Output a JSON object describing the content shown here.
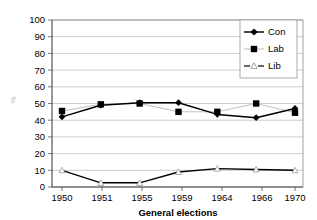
{
  "chart_data": {
    "type": "line",
    "title": "",
    "xlabel": "General elections",
    "ylabel": "%",
    "categories": [
      "1950",
      "1951",
      "1955",
      "1959",
      "1964",
      "1966",
      "1970"
    ],
    "series": [
      {
        "name": "Con",
        "marker": "diamond",
        "line": "solid",
        "color": "#000000",
        "values": [
          42,
          49,
          50.5,
          50.5,
          43.5,
          41.5,
          47
        ]
      },
      {
        "name": "Lab",
        "marker": "square",
        "line": "solid",
        "color": "#000000",
        "values": [
          45.5,
          49.5,
          50,
          45,
          45,
          50,
          44.5
        ]
      },
      {
        "name": "Lib",
        "marker": "triangle-open",
        "line": "dashed",
        "color": "#000000",
        "values": [
          10,
          2.5,
          2.5,
          9,
          11,
          10.5,
          10
        ]
      }
    ],
    "ylim": [
      0,
      100
    ],
    "yticks": [
      "0",
      "10",
      "20",
      "30",
      "40",
      "50",
      "60",
      "70",
      "80",
      "90",
      "100"
    ],
    "grid": true,
    "legend_position": "top-right",
    "legend_entries": [
      "Con",
      "Lab",
      "Lib"
    ]
  },
  "axes": {
    "y_axis_label": "%",
    "x_axis_title": "General elections"
  },
  "legend": {
    "items": [
      {
        "label": "Con"
      },
      {
        "label": "Lab"
      },
      {
        "label": "Lib"
      }
    ]
  },
  "colors": {
    "series_primary": "#000000",
    "gridline": "#a9a9a9",
    "frame": "#8a8a8a",
    "background": "#ffffff"
  }
}
